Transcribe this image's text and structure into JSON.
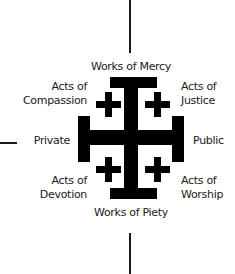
{
  "diagram": {
    "type": "jerusalem-cross-quadrant",
    "colors": {
      "ink": "#1a1a1a",
      "background": "#ffffff"
    },
    "axes": {
      "top": "Works of Mercy",
      "bottom": "Works of Piety",
      "left": "Private",
      "right": "Public"
    },
    "quadrants": {
      "top_left": {
        "line1": "Acts of",
        "line2": "Compassion"
      },
      "top_right": {
        "line1": "Acts of",
        "line2": "Justice"
      },
      "bottom_left": {
        "line1": "Acts of",
        "line2": "Devotion"
      },
      "bottom_right": {
        "line1": "Acts of",
        "line2": "Worship"
      }
    }
  }
}
